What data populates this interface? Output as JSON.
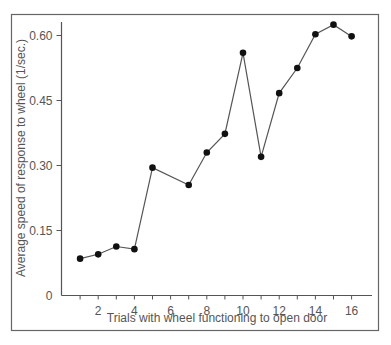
{
  "chart_data": {
    "type": "line",
    "title": "",
    "xlabel": "Trials with wheel functioning to open door",
    "ylabel": "Average speed of response to wheel (1/sec.)",
    "x": [
      1,
      2,
      3,
      4,
      5,
      7,
      8,
      9,
      10,
      11,
      12,
      13,
      14,
      15,
      16
    ],
    "series": [
      {
        "name": "Average speed",
        "values": [
          0.085,
          0.095,
          0.113,
          0.107,
          0.295,
          0.255,
          0.33,
          0.373,
          0.56,
          0.32,
          0.467,
          0.525,
          0.603,
          0.625,
          0.598
        ]
      }
    ],
    "xlim": [
      0,
      17
    ],
    "ylim": [
      0,
      0.63
    ],
    "x_ticks": [
      1,
      2,
      3,
      4,
      5,
      6,
      7,
      8,
      9,
      10,
      11,
      12,
      13,
      14,
      15,
      16
    ],
    "x_tick_labels": [
      "2",
      "4",
      "6",
      "8",
      "10",
      "12",
      "14",
      "16"
    ],
    "x_tick_label_values": [
      2,
      4,
      6,
      8,
      10,
      12,
      14,
      16
    ],
    "y_ticks": [
      0,
      0.15,
      0.3,
      0.45,
      0.6
    ],
    "y_tick_labels": [
      "0",
      "0.15",
      "0.30",
      "0.45",
      "0.60"
    ],
    "grid": false,
    "legend": "none",
    "marker": "filled-circle",
    "colors": {
      "line": "#555555",
      "marker": "#111111",
      "axis": "#555555",
      "frame": "#666666"
    }
  }
}
